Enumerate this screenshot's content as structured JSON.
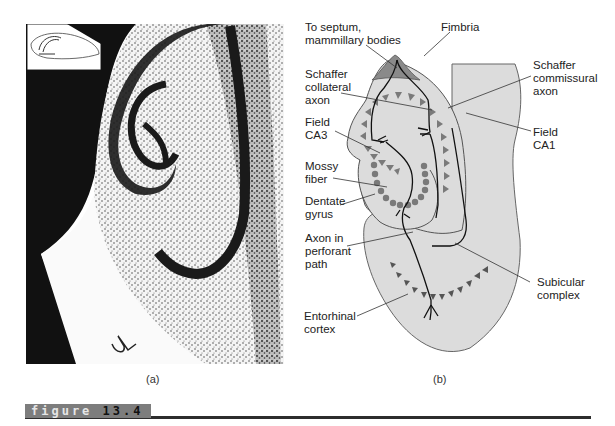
{
  "figure": {
    "label_word": "figure",
    "label_number": "13.4"
  },
  "panel_a": {
    "caption": "(a)",
    "description": "Stained tissue section of the hippocampus with inset orientation sketch"
  },
  "panel_b": {
    "caption": "(b)",
    "labels": {
      "septum": "To septum,\nmammillary bodies",
      "fimbria": "Fimbria",
      "schaffer_collateral": "Schaffer\ncollateral\naxon",
      "schaffer_commissural": "Schaffer\ncommissural\naxon",
      "field_ca3": "Field\nCA3",
      "field_ca1": "Field\nCA1",
      "mossy_fiber": "Mossy\nfiber",
      "dentate_gyrus": "Dentate\ngyrus",
      "perforant_path": "Axon in\nperforant\npath",
      "subicular_complex": "Subicular\ncomplex",
      "entorhinal_cortex": "Entorhinal\ncortex"
    }
  },
  "colors": {
    "region_fill": "#dcdcdc",
    "fimbria_fill": "#8a8a8a",
    "cell_fill": "#7a7a7a",
    "banner_bg": "#7d7d7d",
    "rule": "#2d2d2d"
  }
}
